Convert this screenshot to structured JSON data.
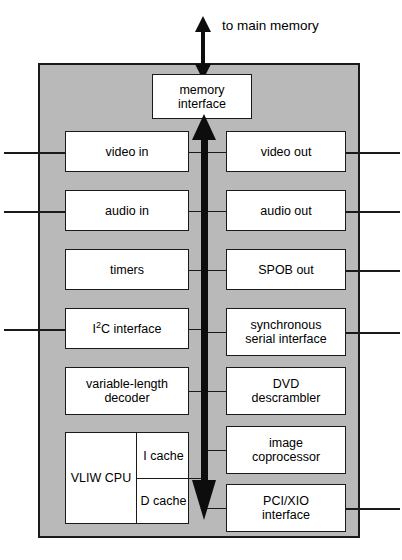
{
  "diagram": {
    "colors": {
      "chip_fill": "#b9b9b9",
      "block_fill": "#ffffff",
      "line": "#1a1a1a",
      "bus": "#0d0d0d",
      "page_bg": "#ffffff"
    },
    "external": {
      "memory_caption": "to main memory",
      "memory_arrow": "double-headed-vertical-arrow"
    },
    "central_bus": {
      "label": "internal bus",
      "style": "thick double-headed vertical arrow"
    },
    "memory_interface": {
      "label": "memory\ninterface"
    },
    "left_blocks": [
      {
        "label": "video in",
        "external_pin": true
      },
      {
        "label": "audio in",
        "external_pin": true
      },
      {
        "label": "timers",
        "external_pin": false
      },
      {
        "label_html": "I<sup>2</sup>C interface",
        "label": "I2C interface",
        "external_pin": true
      },
      {
        "label": "variable-length\ndecoder",
        "external_pin": false
      }
    ],
    "cpu_block": {
      "cpu_label": "VLIW\nCPU",
      "icache_label": "I\ncache",
      "dcache_label": "D\ncache"
    },
    "right_blocks": [
      {
        "label": "video out",
        "external_pin": true
      },
      {
        "label": "audio out",
        "external_pin": true
      },
      {
        "label": "SPOB out",
        "external_pin": true
      },
      {
        "label": "synchronous\nserial interface",
        "external_pin": true
      },
      {
        "label": "DVD\ndescrambler",
        "external_pin": false
      },
      {
        "label": "image\ncoprocessor",
        "external_pin": false
      },
      {
        "label": "PCI/XIO\ninterface",
        "external_pin": true
      }
    ]
  }
}
